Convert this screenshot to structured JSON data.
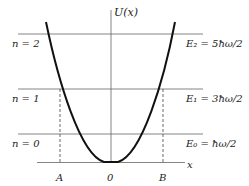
{
  "diagram": {
    "axis": {
      "y_label": "U(x)",
      "x_label": "x",
      "origin_label": "0"
    },
    "turning_points": {
      "left": "A",
      "right": "B"
    },
    "levels": [
      {
        "n_label": "n = 2",
        "e_label": "E₂ = 5ħω/2"
      },
      {
        "n_label": "n = 1",
        "e_label": "E₁ = 3ħω/2"
      },
      {
        "n_label": "n = 0",
        "e_label": "E₀ = ħω/2"
      }
    ],
    "colors": {
      "curve": "#111111",
      "lines": "#555555",
      "text": "#222222"
    }
  }
}
